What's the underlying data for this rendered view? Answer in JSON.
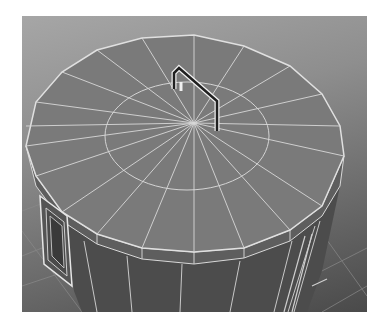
{
  "viewport": {
    "label": "3D viewport",
    "shading": "smooth shaded with wireframe on",
    "background_top": "#a6a6a6",
    "background_bottom": "#4a4a4a",
    "wire_color": "#dcdcdc"
  },
  "model": {
    "object": "cylindrical bin with lid",
    "lid_color": "#7a7a7a",
    "rim_color": "#5e5e5e",
    "body_color": "#4c4c4c",
    "lid_segments": 24,
    "lid_rings": 2,
    "parts": [
      "lid",
      "lid-handle",
      "side-handle",
      "body"
    ]
  }
}
